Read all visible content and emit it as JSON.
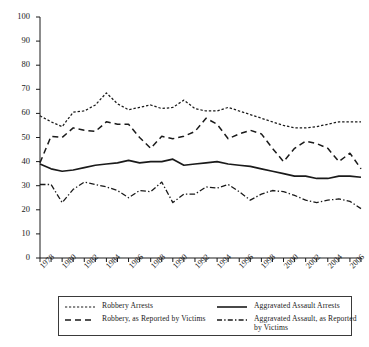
{
  "chart_data": {
    "type": "line",
    "title": "",
    "subtitle": "",
    "xlabel": "",
    "ylabel": "",
    "xlim": [
      1978,
      2007
    ],
    "ylim": [
      0,
      100
    ],
    "grid": false,
    "legend_position": "bottom",
    "y_ticks": [
      0,
      10,
      20,
      30,
      40,
      50,
      60,
      70,
      80,
      90,
      100
    ],
    "y_tick_labels": [
      "0",
      "10",
      "20",
      "30",
      "40",
      "50",
      "60",
      "70",
      "80",
      "90",
      "100"
    ],
    "x_ticks": [
      1978,
      1980,
      1982,
      1984,
      1986,
      1988,
      1990,
      1992,
      1994,
      1996,
      1998,
      2000,
      2002,
      2004,
      2006
    ],
    "x_tick_labels": [
      "1978",
      "1980",
      "1982",
      "1984",
      "1986",
      "1988",
      "1990",
      "1992",
      "1994",
      "1996",
      "1998",
      "2000",
      "2002",
      "2004",
      "2006"
    ],
    "x": [
      1978,
      1979,
      1980,
      1981,
      1982,
      1983,
      1984,
      1985,
      1986,
      1987,
      1988,
      1989,
      1990,
      1991,
      1992,
      1993,
      1994,
      1995,
      1996,
      1997,
      1998,
      1999,
      2000,
      2001,
      2002,
      2003,
      2004,
      2005,
      2006,
      2007
    ],
    "series": [
      {
        "name": "Robbery Arrests",
        "dash": "dotted",
        "color": "#1a1a1a",
        "values": [
          59.0,
          56.5,
          54.5,
          60.5,
          61.0,
          63.5,
          68.5,
          64.0,
          61.5,
          62.5,
          63.5,
          62.0,
          62.5,
          65.5,
          62.0,
          61.0,
          61.0,
          62.5,
          61.0,
          59.5,
          58.0,
          56.5,
          55.0,
          54.0,
          54.0,
          54.5,
          55.5,
          56.5,
          56.5,
          56.5
        ]
      },
      {
        "name": "Robbery, as Reported by Victims",
        "dash": "dashed",
        "color": "#1a1a1a",
        "values": [
          39.5,
          50.5,
          50.0,
          54.0,
          53.0,
          52.5,
          56.5,
          55.5,
          55.5,
          50.0,
          45.5,
          50.5,
          49.5,
          50.5,
          52.5,
          58.0,
          55.5,
          49.5,
          51.5,
          53.0,
          51.5,
          45.5,
          40.0,
          45.5,
          48.5,
          47.5,
          45.5,
          40.0,
          43.5,
          37.0
        ]
      },
      {
        "name": "Aggravated Assault Arrests",
        "dash": "solid",
        "color": "#1a1a1a",
        "values": [
          39.0,
          37.0,
          36.0,
          36.5,
          37.5,
          38.5,
          39.0,
          39.5,
          40.5,
          39.5,
          40.0,
          40.0,
          41.0,
          38.5,
          39.0,
          39.5,
          40.0,
          39.0,
          38.5,
          38.0,
          37.0,
          36.0,
          35.0,
          34.0,
          34.0,
          33.0,
          33.0,
          34.0,
          34.0,
          33.5
        ]
      },
      {
        "name": "Aggravated Assault, as Reported by Victims",
        "dash": "dash-dot",
        "color": "#1a1a1a",
        "values": [
          30.5,
          30.5,
          23.0,
          28.5,
          31.5,
          30.5,
          29.5,
          28.0,
          25.0,
          28.0,
          27.5,
          31.5,
          23.0,
          26.5,
          26.5,
          29.5,
          29.0,
          30.5,
          27.5,
          24.0,
          26.5,
          28.0,
          27.5,
          26.0,
          24.0,
          23.0,
          24.0,
          24.5,
          23.5,
          20.5
        ]
      }
    ]
  },
  "legend": {
    "entries": [
      {
        "label": "Robbery Arrests",
        "style": "dotted"
      },
      {
        "label": "Aggravated Assault Arrests",
        "style": "solid"
      },
      {
        "label": "Robbery, as Reported by Victims",
        "style": "dashed"
      },
      {
        "label": "Aggravated Assault, as Reported by Victims",
        "style": "dash-dot"
      }
    ]
  }
}
